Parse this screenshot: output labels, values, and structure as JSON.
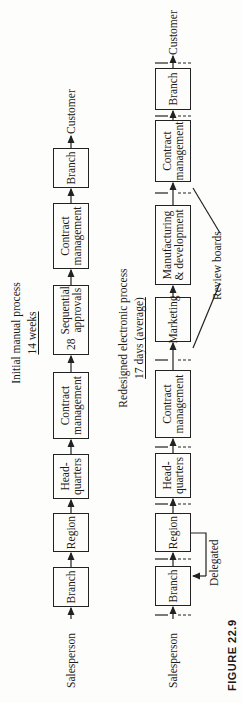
{
  "figure": {
    "caption": "FIGURE 22.9"
  },
  "manual_process": {
    "title": "Initial manual process",
    "duration": "14 weeks",
    "start_label": "Salesperson",
    "end_label": "Customer",
    "steps": [
      {
        "label": "Branch"
      },
      {
        "label": "Region"
      },
      {
        "label": "Head-\nquarters"
      },
      {
        "label": "Contract\nmanagement"
      },
      {
        "label": "Sequential\napprovals",
        "count": "28"
      },
      {
        "label": "Contract\nmanagement"
      },
      {
        "label": "Branch"
      }
    ]
  },
  "electronic_process": {
    "title": "Redesigned electronic process",
    "duration": "17 days (average)",
    "start_label": "Salesperson",
    "end_label": "Customer",
    "steps": [
      {
        "label": "Branch"
      },
      {
        "label": "Region"
      },
      {
        "label": "Head-\nquarters"
      },
      {
        "label": "Contract\nmanagement"
      },
      {
        "label": "Marketing"
      },
      {
        "label": "Manufacturing\n& development"
      },
      {
        "label": "Contract\nmanagement"
      },
      {
        "label": "Branch"
      }
    ],
    "delegated_label": "Delegated",
    "review_boards_label": "Review boards"
  }
}
